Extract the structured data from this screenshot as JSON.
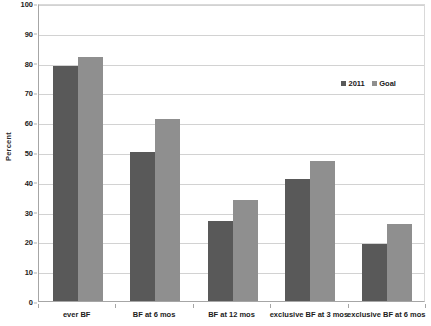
{
  "chart_data": {
    "type": "bar",
    "title": "",
    "xlabel": "",
    "ylabel": "Percent",
    "ylim": [
      0,
      100
    ],
    "ytick_step": 10,
    "yticks": [
      0,
      10,
      20,
      30,
      40,
      50,
      60,
      70,
      80,
      90,
      100
    ],
    "ytick_labels": [
      "0",
      "10",
      "20",
      "30",
      "40",
      "50",
      "60",
      "70",
      "80",
      "90",
      "100"
    ],
    "grid": true,
    "legend_position": "upper right (inside plot)",
    "categories": [
      "ever BF",
      "BF at 6 mos",
      "BF at 12 mos",
      "exclusive BF at 3 mos",
      "exclusive BF at 6 mos"
    ],
    "series": [
      {
        "name": "2011",
        "color": "#595959",
        "values": [
          79,
          50,
          27,
          41,
          19
        ]
      },
      {
        "name": "Goal",
        "color": "#8f8f8f",
        "values": [
          82,
          61,
          34,
          47,
          26
        ]
      }
    ]
  }
}
